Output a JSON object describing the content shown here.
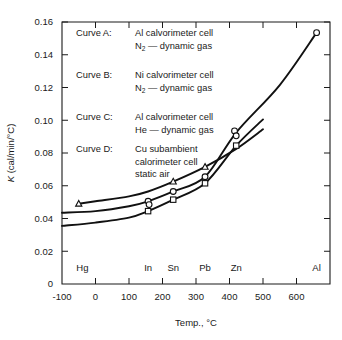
{
  "chart_data": {
    "type": "line",
    "title": "",
    "xlabel": "Temp., °C",
    "ylabel": "K (cal/min/°C)",
    "ylabel_italic_symbol": "K",
    "ylabel_rest": " (cal/min/°C)",
    "xlim": [
      -100,
      700
    ],
    "ylim": [
      0,
      0.16
    ],
    "grid": false,
    "x_ticks": [
      -100,
      0,
      100,
      200,
      300,
      400,
      500,
      600,
      700
    ],
    "x_tick_labels": [
      "-100",
      "0",
      "100",
      "200",
      "300",
      "400",
      "500",
      "600",
      ""
    ],
    "y_ticks": [
      0,
      0.02,
      0.04,
      0.06,
      0.08,
      0.1,
      0.12,
      0.14,
      0.16
    ],
    "y_tick_labels": [
      "0",
      "0.02",
      "0.04",
      "0.06",
      "0.08",
      "0.10",
      "0.12",
      "0.14",
      "0.16"
    ],
    "element_markers": [
      {
        "name": "Hg",
        "x": -39
      },
      {
        "name": "In",
        "x": 157
      },
      {
        "name": "Sn",
        "x": 232
      },
      {
        "name": "Pb",
        "x": 327
      },
      {
        "name": "Zn",
        "x": 420
      },
      {
        "name": "Al",
        "x": 660
      }
    ],
    "series": [
      {
        "name": "Curve A",
        "marker": "triangle",
        "x": [
          -50,
          0,
          100,
          157,
          232,
          327,
          420,
          500
        ],
        "y": [
          0.049,
          0.0505,
          0.0535,
          0.0565,
          0.0625,
          0.0715,
          0.0825,
          0.0945
        ],
        "points": [
          {
            "x": -50,
            "y": 0.049
          },
          {
            "x": 232,
            "y": 0.0625
          },
          {
            "x": 327,
            "y": 0.0715
          }
        ]
      },
      {
        "name": "Curve B",
        "marker": "circle",
        "x": [
          -100,
          0,
          100,
          157,
          232,
          327,
          420,
          550,
          660
        ],
        "y": [
          0.0435,
          0.0445,
          0.0475,
          0.0505,
          0.0565,
          0.0655,
          0.0925,
          0.1215,
          0.1535
        ],
        "points": [
          {
            "x": 157,
            "y": 0.0505
          },
          {
            "x": 160,
            "y": 0.0485
          },
          {
            "x": 232,
            "y": 0.0565
          },
          {
            "x": 327,
            "y": 0.0655
          },
          {
            "x": 415,
            "y": 0.0935
          },
          {
            "x": 420,
            "y": 0.0905
          },
          {
            "x": 660,
            "y": 0.1535
          }
        ]
      },
      {
        "name": "Curve C",
        "marker": "square",
        "x": [
          -100,
          0,
          100,
          157,
          232,
          327,
          420,
          500
        ],
        "y": [
          0.0355,
          0.0375,
          0.0405,
          0.0445,
          0.0515,
          0.0615,
          0.0845,
          0.1005
        ],
        "points": [
          {
            "x": 157,
            "y": 0.0445
          },
          {
            "x": 232,
            "y": 0.0515
          },
          {
            "x": 327,
            "y": 0.0615
          },
          {
            "x": 420,
            "y": 0.0845
          }
        ]
      }
    ]
  },
  "legend": {
    "entries": [
      {
        "key": "Curve A:",
        "line1": "Al  calvorimeter cell",
        "line2_pre": "N",
        "line2_sub": "2",
        "line2_post": " — dynamic gas",
        "line3": ""
      },
      {
        "key": "Curve B:",
        "line1": "Ni  calvorimeter cell",
        "line2_pre": "N",
        "line2_sub": "2",
        "line2_post": " — dynamic gas",
        "line3": ""
      },
      {
        "key": "Curve C:",
        "line1": "Al  calvorimeter cell",
        "line2_pre": "He",
        "line2_sub": "",
        "line2_post": " — dynamic gas",
        "line3": ""
      },
      {
        "key": "Curve D:",
        "line1": "Cu subambient",
        "line2_pre": "calorimeter cell",
        "line2_sub": "",
        "line2_post": "",
        "line3": "static air"
      }
    ]
  },
  "colors": {
    "ink": "#1a1a1a",
    "curve": "#111111",
    "background": "#ffffff",
    "marker_fill": "#ffffff"
  }
}
